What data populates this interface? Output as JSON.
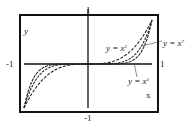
{
  "chart_data": {
    "type": "line",
    "title": "",
    "xlabel": "x",
    "ylabel": "y",
    "xlim": [
      -1,
      1
    ],
    "ylim": [
      -1,
      1
    ],
    "grid": false,
    "legend": "inline annotations",
    "tick_labels": {
      "x_left": "-1",
      "x_right": "1",
      "y_top": "1",
      "y_bottom": "-1"
    },
    "series": [
      {
        "name": "y = x^3",
        "label": "y = x³",
        "exponent": 3,
        "style": "dashed"
      },
      {
        "name": "y = x^5",
        "label": "y = x⁵",
        "exponent": 5,
        "style": "dashed"
      },
      {
        "name": "y = x^7",
        "label": "y = x⁷",
        "exponent": 7,
        "style": "dashed"
      }
    ],
    "annotations": [
      {
        "text": "y = x³",
        "points_to": "y = x^3"
      },
      {
        "text": "y = x⁷",
        "points_to": "y = x^7",
        "leader_line": true
      },
      {
        "text": "y = x⁵",
        "points_to": "y = x^5",
        "leader_line": true
      }
    ]
  },
  "labels": {
    "x_axis": "x",
    "y_axis": "y",
    "tick_x_left": "-1",
    "tick_x_right": "1",
    "tick_y_top": "1",
    "tick_y_bottom": "-1",
    "curve_x3": "y = x",
    "curve_x3_exp": "3",
    "curve_x5": "y = x",
    "curve_x5_exp": "5",
    "curve_x7": "y = x",
    "curve_x7_exp": "7"
  },
  "colors": {
    "frame": "#111111",
    "curves": "#222222",
    "background": "#ffffff"
  }
}
